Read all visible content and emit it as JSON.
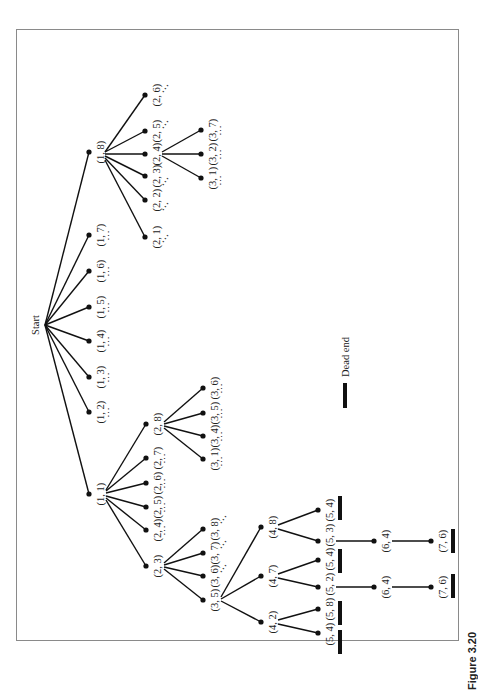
{
  "figure": {
    "caption": "Figure 3.20",
    "orientation": "rotated-90-ccw",
    "legend": {
      "symbol": "thick-bar",
      "label": "Dead end"
    },
    "root_label": "Start",
    "ellipsis": "⋯"
  },
  "tree": {
    "root": "Start",
    "level1": [
      "(1, 1)",
      "(1, 2)",
      "(1, 3)",
      "(1, 4)",
      "(1, 5)",
      "(1, 6)",
      "(1, 7)",
      "(1, 8)"
    ],
    "branch_1_8": {
      "children": [
        "(2, 1)",
        "(2, 2)",
        "(2, 3)",
        "(2, 4)",
        "(2, 5)",
        "(2, 6)"
      ],
      "branch_2_4": {
        "children": [
          "(3, 1)",
          "(3, 2)",
          "(3, 7)"
        ]
      }
    },
    "branch_1_1": {
      "children": [
        "(2, 3)",
        "(2, 4)",
        "(2, 5)",
        "(2, 6)",
        "(2, 7)",
        "(2, 8)"
      ],
      "branch_2_8": {
        "children": [
          "(3, 1)",
          "(3, 4)",
          "(3, 5)",
          "(3, 6)"
        ]
      },
      "branch_2_3": {
        "children": [
          "(3, 5)",
          "(3, 6)",
          "(3, 7)",
          "(3, 8)"
        ],
        "branch_3_5": {
          "children": [
            "(4, 2)",
            "(4, 7)",
            "(4, 8)"
          ],
          "branch_4_2": {
            "children": [
              "(5, 4)",
              "(5, 8)"
            ],
            "dead_ends": [
              "(5, 4)",
              "(5, 8)"
            ]
          },
          "branch_4_7": {
            "children": [
              "(5, 2)",
              "(5, 4)"
            ],
            "dead_ends": [
              "(5, 4)"
            ],
            "path": [
              "(5, 2)",
              "(6, 4)",
              "(7, 6)"
            ],
            "final_dead_end": "(7, 6)"
          },
          "branch_4_8": {
            "children": [
              "(5, 3)",
              "(5, 4)"
            ],
            "dead_ends": [
              "(5, 4)"
            ],
            "path": [
              "(5, 3)",
              "(6, 4)",
              "(7, 6)"
            ],
            "final_dead_end": "(7, 6)"
          }
        }
      }
    }
  },
  "labels": {
    "start": "Start",
    "l1": {
      "n18": "(1, 8)",
      "n17": "(1, 7)",
      "n16": "(1, 6)",
      "n15": "(1, 5)",
      "n14": "(1, 4)",
      "n13": "(1, 3)",
      "n12": "(1, 2)",
      "n11": "(1, 1)"
    },
    "a": {
      "n26": "(2, 6)",
      "n25": "(2, 5)",
      "n24": "(2, 4)",
      "n23": "(2, 3)",
      "n22": "(2, 2)",
      "n21": "(2, 1)"
    },
    "a3": {
      "n37": "(3, 7)",
      "n32": "(3, 2)",
      "n31": "(3, 1)"
    },
    "b": {
      "n28": "(2, 8)",
      "n27": "(2, 7)",
      "n26": "(2, 6)",
      "n25": "(2, 5)",
      "n24": "(2, 4)",
      "n23": "(2, 3)"
    },
    "b3": {
      "n36": "(3, 6)",
      "n35": "(3, 5)",
      "n34": "(3, 4)",
      "n31": "(3, 1)"
    },
    "c3": {
      "n38": "(3, 8)",
      "n37": "(3, 7)",
      "n36": "(3, 6)",
      "n35": "(3, 5)"
    },
    "d4": {
      "n48": "(4, 8)",
      "n47": "(4, 7)",
      "n42": "(4, 2)"
    },
    "e5": {
      "a54": "(5, 4)",
      "n53": "(5, 3)",
      "b54": "(5, 4)",
      "n52": "(5, 2)",
      "n58": "(5, 8)",
      "c54": "(5, 4)"
    },
    "f6": {
      "a64": "(6, 4)",
      "b64": "(6, 4)"
    },
    "g7": {
      "a76": "(7, 6)",
      "b76": "(7, 6)"
    },
    "dead_end": "Dead end",
    "caption": "Figure 3.20"
  },
  "colors": {
    "ink": "#111111",
    "frame": "#8a8a8a",
    "background": "#ffffff"
  }
}
